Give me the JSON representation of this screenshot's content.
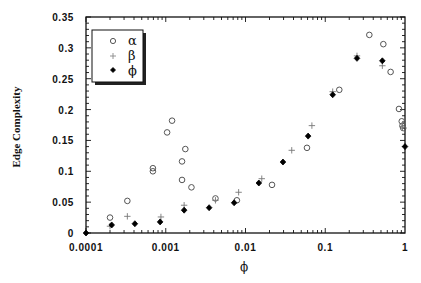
{
  "chart_data": {
    "type": "scatter",
    "title": "",
    "xlabel": "ϕ",
    "ylabel": "Edge Complexity",
    "xscale": "log",
    "xlim": [
      0.0001,
      1
    ],
    "ylim": [
      0,
      0.35
    ],
    "grid": false,
    "legend_position": "upper-left (inset box with shadow)",
    "x_ticks": [
      {
        "value": 0.0001,
        "label": "0.0001"
      },
      {
        "value": 0.001,
        "label": "0.001"
      },
      {
        "value": 0.01,
        "label": "0.01"
      },
      {
        "value": 0.1,
        "label": "0.1"
      },
      {
        "value": 1,
        "label": "1"
      }
    ],
    "y_ticks": [
      {
        "value": 0,
        "label": "0"
      },
      {
        "value": 0.05,
        "label": "0.05"
      },
      {
        "value": 0.1,
        "label": "0.1"
      },
      {
        "value": 0.15,
        "label": "0.15"
      },
      {
        "value": 0.2,
        "label": "0.2"
      },
      {
        "value": 0.25,
        "label": "0.25"
      },
      {
        "value": 0.3,
        "label": "0.3"
      },
      {
        "value": 0.35,
        "label": "0.35"
      }
    ],
    "series": [
      {
        "name": "α",
        "marker": "open-circle",
        "color": "#555555",
        "points": [
          [
            0.0002,
            0.025
          ],
          [
            0.00033,
            0.052
          ],
          [
            0.00069,
            0.105
          ],
          [
            0.00069,
            0.1
          ],
          [
            0.00104,
            0.163
          ],
          [
            0.0012,
            0.182
          ],
          [
            0.0016,
            0.116
          ],
          [
            0.00176,
            0.136
          ],
          [
            0.0016,
            0.086
          ],
          [
            0.0021,
            0.074
          ],
          [
            0.0042,
            0.056
          ],
          [
            0.0078,
            0.053
          ],
          [
            0.0215,
            0.078
          ],
          [
            0.059,
            0.138
          ],
          [
            0.15,
            0.232
          ],
          [
            0.357,
            0.321
          ],
          [
            0.535,
            0.306
          ],
          [
            0.66,
            0.261
          ],
          [
            0.84,
            0.201
          ],
          [
            0.91,
            0.181
          ],
          [
            0.93,
            0.174
          ],
          [
            0.95,
            0.17
          ]
        ]
      },
      {
        "name": "β",
        "marker": "plus",
        "color": "#777777",
        "points": [
          [
            0.0002,
            0.011
          ],
          [
            0.00033,
            0.027
          ],
          [
            0.00087,
            0.026
          ],
          [
            0.0017,
            0.045
          ],
          [
            0.0042,
            0.053
          ],
          [
            0.0082,
            0.066
          ],
          [
            0.016,
            0.088
          ],
          [
            0.038,
            0.134
          ],
          [
            0.068,
            0.174
          ],
          [
            0.124,
            0.229
          ],
          [
            0.25,
            0.287
          ],
          [
            0.52,
            0.271
          ],
          [
            0.93,
            0.172
          ]
        ]
      },
      {
        "name": "ϕ",
        "marker": "filled-diamond",
        "color": "#000000",
        "points": [
          [
            0.0001,
            0.0
          ],
          [
            0.00021,
            0.013
          ],
          [
            0.00041,
            0.015
          ],
          [
            0.00085,
            0.018
          ],
          [
            0.0017,
            0.037
          ],
          [
            0.0035,
            0.041
          ],
          [
            0.0072,
            0.049
          ],
          [
            0.0147,
            0.081
          ],
          [
            0.0295,
            0.115
          ],
          [
            0.061,
            0.157
          ],
          [
            0.124,
            0.224
          ],
          [
            0.25,
            0.283
          ],
          [
            0.52,
            0.279
          ],
          [
            1.0,
            0.14
          ]
        ]
      }
    ]
  },
  "legend": {
    "items": [
      {
        "symbol": "open-circle",
        "label": "α"
      },
      {
        "symbol": "plus",
        "label": "β"
      },
      {
        "symbol": "filled-diamond",
        "label": "ϕ"
      }
    ]
  }
}
